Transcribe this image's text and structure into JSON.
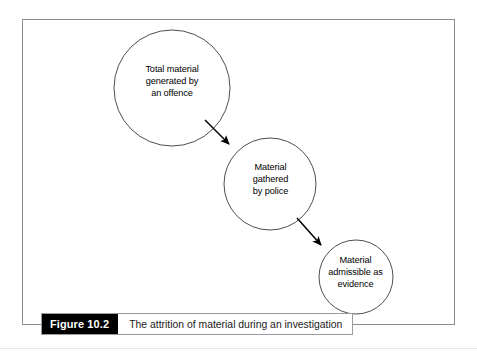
{
  "figure": {
    "caption_number": "Figure 10.2",
    "caption_text": "The attrition of material during an investigation",
    "frame_color": "#8d8d93",
    "caption_box_color": "#000000",
    "caption_text_color": "#1a1a1a",
    "background_color": "#ffffff"
  },
  "diagram": {
    "type": "flow",
    "stroke_color": "#3a3a3a",
    "arrow_color": "#000000",
    "nodes": [
      {
        "id": "node-1",
        "label": "Total material\ngenerated by\nan offence",
        "shape": "circle",
        "cx": 172,
        "cy": 88,
        "r": 58
      },
      {
        "id": "node-2",
        "label": "Material\ngathered\nby police",
        "shape": "circle",
        "cx": 270,
        "cy": 184,
        "r": 46
      },
      {
        "id": "node-3",
        "label": "Material\nadmissible as\nevidence",
        "shape": "circle",
        "cx": 356,
        "cy": 277,
        "r": 37
      }
    ],
    "arrows": [
      {
        "id": "arrow-1",
        "from": "node-1",
        "to": "node-2",
        "x1": 205,
        "y1": 120,
        "x2": 232,
        "y2": 147
      },
      {
        "id": "arrow-2",
        "from": "node-2",
        "to": "node-3",
        "x1": 297,
        "y1": 218,
        "x2": 324,
        "y2": 248
      }
    ]
  }
}
